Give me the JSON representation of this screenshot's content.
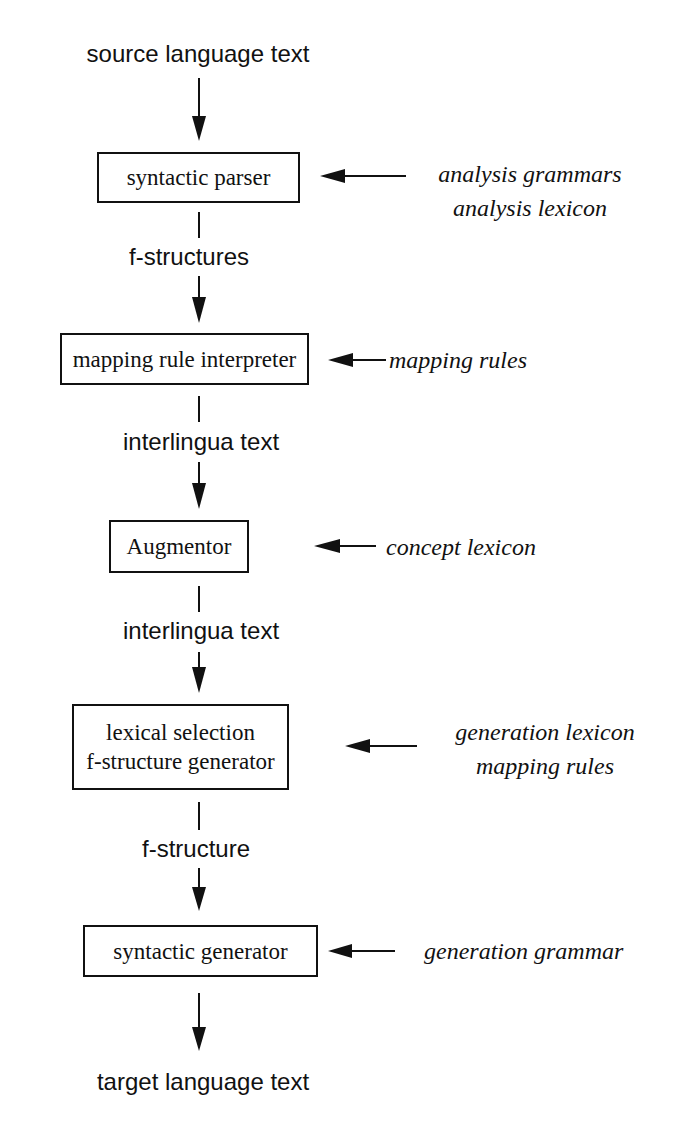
{
  "caption_partial": "the MT system architecture (top cut off)",
  "flow": {
    "input": "source language text",
    "output": "target language text",
    "intermediates": [
      "f-structures",
      "interlingua text",
      "interlingua text",
      "f-structure"
    ]
  },
  "modules": [
    {
      "lines": [
        "syntactic parser"
      ],
      "resources": [
        "analysis grammars",
        "analysis lexicon"
      ]
    },
    {
      "lines": [
        "mapping rule interpreter"
      ],
      "resources": [
        "mapping rules"
      ]
    },
    {
      "lines": [
        "Augmentor"
      ],
      "resources": [
        "concept lexicon"
      ]
    },
    {
      "lines": [
        "lexical selection",
        "f-structure generator"
      ],
      "resources": [
        "generation lexicon",
        "mapping rules"
      ]
    },
    {
      "lines": [
        "syntactic generator"
      ],
      "resources": [
        "generation grammar"
      ]
    }
  ]
}
